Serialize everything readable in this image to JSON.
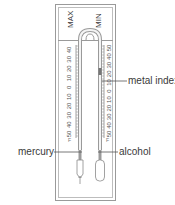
{
  "diagram": {
    "headings": {
      "max": "MAX",
      "min": "MIN"
    },
    "labels": {
      "metal_index": "metal index",
      "mercury": "mercury",
      "alcohol": "alcohol"
    },
    "scales": {
      "max_scale": [
        "40",
        "30",
        "20",
        "10",
        "0",
        "10",
        "20",
        "30",
        "40",
        "50"
      ],
      "min_scale": [
        "50",
        "40",
        "30",
        "20",
        "10",
        "0",
        "10",
        "20",
        "30",
        "40",
        "50"
      ]
    },
    "colors": {
      "frame": "#8a8a8a",
      "text": "#3a3a3a",
      "tube": "#9a9a9a",
      "scale_text": "#555555"
    }
  }
}
